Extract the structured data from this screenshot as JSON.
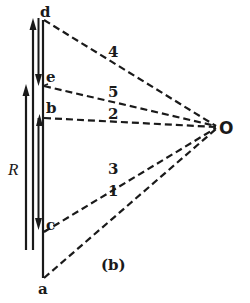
{
  "figure": {
    "caption": "(b)",
    "point_O": "O",
    "resistor_label": "R",
    "points": {
      "d": "d",
      "e": "e",
      "b": "b",
      "c": "c",
      "a": "a"
    },
    "lines": [
      {
        "id": "4",
        "label": "4",
        "from": "d",
        "to": "O"
      },
      {
        "id": "5",
        "label": "5",
        "from": "e",
        "to": "O"
      },
      {
        "id": "2",
        "label": "2",
        "from": "b",
        "to": "O"
      },
      {
        "id": "3",
        "label": "3",
        "from": "c",
        "to": "O"
      },
      {
        "id": "1",
        "label": "1",
        "from": "a",
        "to": "O"
      }
    ],
    "colors": {
      "ink": "#1a1a1a",
      "background": "#ffffff"
    }
  }
}
